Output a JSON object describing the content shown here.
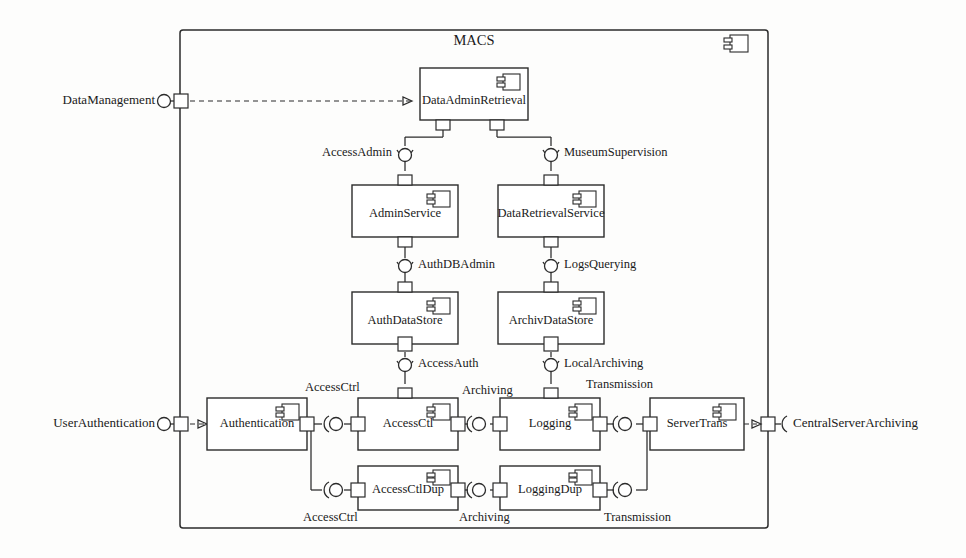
{
  "diagram": {
    "kind": "uml-component-diagram",
    "title": "MACS",
    "frame": {
      "x": 180,
      "y": 30,
      "w": 588,
      "h": 498
    },
    "stroke_color": "#2b2b2b",
    "fill_color": "#ffffff",
    "background": "#fdfdfc"
  },
  "external_interfaces": [
    {
      "name": "DataManagement",
      "label": "DataManagement",
      "side": "left",
      "kind": "provided-lollipop",
      "ball_x": 164,
      "ball_y": 101,
      "port_x": 180,
      "port_y": 101,
      "text_x": 155,
      "text_y": 101,
      "connector": "dashed-delegation"
    },
    {
      "name": "UserAuthentication",
      "label": "UserAuthentication",
      "side": "left",
      "kind": "provided-lollipop",
      "ball_x": 164,
      "ball_y": 424,
      "port_x": 180,
      "port_y": 424,
      "text_x": 155,
      "text_y": 424,
      "connector": "dashed-delegation"
    },
    {
      "name": "CentralServerArchiving",
      "label": "CentralServerArchiving",
      "side": "right",
      "kind": "required-socket",
      "ball_x": 784,
      "ball_y": 424,
      "port_x": 768,
      "port_y": 424,
      "text_x": 793,
      "text_y": 424,
      "connector": "dashed-delegation"
    }
  ],
  "components": [
    {
      "id": "DataAdminRetrieval",
      "label": "DataAdminRetrieval",
      "x": 420,
      "y": 68,
      "w": 108,
      "h": 52
    },
    {
      "id": "AdminService",
      "label": "AdminService",
      "x": 352,
      "y": 185,
      "w": 106,
      "h": 52
    },
    {
      "id": "DataRetrievalService",
      "label": "DataRetrievalService",
      "x": 498,
      "y": 185,
      "w": 106,
      "h": 52
    },
    {
      "id": "AuthDataStore",
      "label": "AuthDataStore",
      "x": 352,
      "y": 292,
      "w": 106,
      "h": 52
    },
    {
      "id": "ArchivDataStore",
      "label": "ArchivDataStore",
      "x": 498,
      "y": 292,
      "w": 106,
      "h": 52
    },
    {
      "id": "Authentication",
      "label": "Authentication",
      "x": 207,
      "y": 398,
      "w": 100,
      "h": 52
    },
    {
      "id": "AccessCtl",
      "label": "AccessCtl",
      "x": 358,
      "y": 398,
      "w": 100,
      "h": 52
    },
    {
      "id": "Logging",
      "label": "Logging",
      "x": 500,
      "y": 398,
      "w": 100,
      "h": 52
    },
    {
      "id": "ServerTrans",
      "label": "ServerTrans",
      "x": 650,
      "y": 398,
      "w": 94,
      "h": 52
    },
    {
      "id": "AccessCtlDup",
      "label": "AccessCtlDup",
      "x": 358,
      "y": 466,
      "w": 100,
      "h": 44
    },
    {
      "id": "LoggingDup",
      "label": "LoggingDup",
      "x": 500,
      "y": 466,
      "w": 100,
      "h": 44
    }
  ],
  "assembly_interfaces": [
    {
      "name": "AccessAdmin",
      "label": "AccessAdmin",
      "orient": "vertical",
      "x": 405,
      "y": 153,
      "text_x": 392,
      "text_y": 153,
      "anchor": "end"
    },
    {
      "name": "MuseumSupervision",
      "label": "MuseumSupervision",
      "orient": "vertical",
      "x": 551,
      "y": 153,
      "text_x": 564,
      "text_y": 153,
      "anchor": "start"
    },
    {
      "name": "AuthDBAdmin",
      "label": "AuthDBAdmin",
      "orient": "vertical",
      "x": 405,
      "y": 265,
      "text_x": 418,
      "text_y": 265,
      "anchor": "start"
    },
    {
      "name": "LogsQuerying",
      "label": "LogsQuerying",
      "orient": "vertical",
      "x": 551,
      "y": 265,
      "text_x": 564,
      "text_y": 265,
      "anchor": "start"
    },
    {
      "name": "AccessAuth",
      "label": "AccessAuth",
      "orient": "vertical",
      "x": 405,
      "y": 364,
      "text_x": 418,
      "text_y": 364,
      "anchor": "start"
    },
    {
      "name": "LocalArchiving",
      "label": "LocalArchiving",
      "orient": "vertical",
      "x": 551,
      "y": 364,
      "text_x": 564,
      "text_y": 364,
      "anchor": "start"
    },
    {
      "name": "AccessCtrlTop",
      "label": "AccessCtrl",
      "orient": "horizontal",
      "x": 333,
      "y": 424,
      "text_x": 333,
      "text_y": 388,
      "anchor": "middle"
    },
    {
      "name": "ArchivingTop",
      "label": "Archiving",
      "orient": "horizontal",
      "x": 479,
      "y": 424,
      "text_x": 479,
      "text_y": 390,
      "anchor": "middle"
    },
    {
      "name": "TransmissionTop",
      "label": "Transmission",
      "orient": "horizontal",
      "x": 625,
      "y": 424,
      "text_x": 638,
      "text_y": 385,
      "anchor": "middle"
    },
    {
      "name": "AccessCtrlDupB",
      "label": "AccessCtrl",
      "orient": "horizontal",
      "x": 333,
      "y": 490,
      "text_x": 333,
      "text_y": 518,
      "anchor": "middle"
    },
    {
      "name": "ArchivingDupB",
      "label": "Archiving",
      "orient": "horizontal",
      "x": 479,
      "y": 490,
      "text_x": 479,
      "text_y": 518,
      "anchor": "middle"
    },
    {
      "name": "TransmissionDupB",
      "label": "Transmission",
      "orient": "horizontal",
      "x": 625,
      "y": 490,
      "text_x": 632,
      "text_y": 518,
      "anchor": "middle"
    }
  ]
}
